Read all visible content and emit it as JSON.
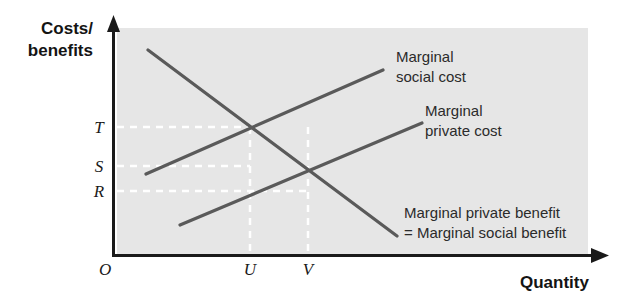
{
  "figure": {
    "kind": "economics-externality-diagram",
    "background_color": "#ffffff",
    "plot_fill": "#e6e6e6",
    "axis_color": "#1a1a1a",
    "curve_color": "#5a5a5a",
    "guide_color": "#ffffff"
  },
  "axes": {
    "y_title_line1": "Costs/",
    "y_title_line2": "benefits",
    "x_title": "Quantity",
    "origin_label": "O"
  },
  "y_marks": [
    {
      "label": "T",
      "y": 127
    },
    {
      "label": "S",
      "y": 166
    },
    {
      "label": "R",
      "y": 191
    }
  ],
  "x_marks": [
    {
      "label": "U",
      "x": 250
    },
    {
      "label": "V",
      "x": 308
    }
  ],
  "curves": [
    {
      "name": "marginal-social-cost",
      "label_line1": "Marginal",
      "label_line2": "social cost",
      "x1": 146,
      "y1": 174,
      "x2": 383,
      "y2": 70
    },
    {
      "name": "marginal-private-cost",
      "label_line1": "Marginal",
      "label_line2": "private cost",
      "x1": 180,
      "y1": 225,
      "x2": 422,
      "y2": 123
    },
    {
      "name": "marginal-private-benefit",
      "label_line1": "Marginal private benefit",
      "label_line2": "= Marginal social benefit",
      "x1": 148,
      "y1": 50,
      "x2": 397,
      "y2": 236
    }
  ],
  "chart_data": {
    "type": "line",
    "title": "",
    "xlabel": "Quantity",
    "ylabel": "Costs/benefits",
    "grid": false,
    "legend": "inline-annotations",
    "xtick_labels": [
      "O",
      "U",
      "V"
    ],
    "ytick_labels": [
      "O",
      "R",
      "S",
      "T"
    ],
    "series": [
      {
        "name": "Marginal social cost",
        "slope": "upward",
        "points": [
          [
            146,
            174
          ],
          [
            383,
            70
          ]
        ]
      },
      {
        "name": "Marginal private cost",
        "slope": "upward",
        "points": [
          [
            180,
            225
          ],
          [
            422,
            123
          ]
        ]
      },
      {
        "name": "Marginal private benefit = Marginal social benefit",
        "slope": "downward",
        "points": [
          [
            148,
            50
          ],
          [
            397,
            236
          ]
        ]
      }
    ],
    "intersections": [
      {
        "name": "social-optimum",
        "curves": [
          "Marginal social cost",
          "Marginal private benefit = Marginal social benefit"
        ],
        "x_label": "U",
        "y_label": "T"
      },
      {
        "name": "market-equilibrium",
        "curves": [
          "Marginal private cost",
          "Marginal private benefit = Marginal social benefit"
        ],
        "x_label": "V",
        "y_label": "R"
      }
    ],
    "guides": [
      {
        "orientation": "horizontal",
        "from_label": "T",
        "to_x_label": "U"
      },
      {
        "orientation": "horizontal",
        "from_label": "S",
        "to_x_label": "U"
      },
      {
        "orientation": "horizontal",
        "from_label": "R",
        "to_x_label": "V"
      },
      {
        "orientation": "vertical",
        "at_x_label": "U"
      },
      {
        "orientation": "vertical",
        "at_x_label": "V"
      }
    ]
  }
}
